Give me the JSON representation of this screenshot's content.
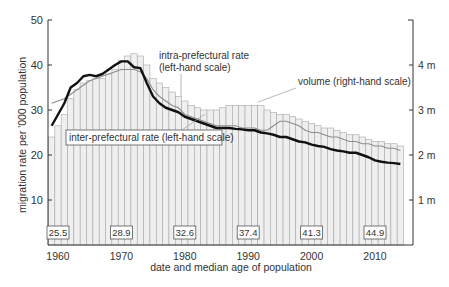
{
  "chart_data": {
    "type": "bar+line",
    "title": "",
    "xlabel": "date and median age of population",
    "ylabel": "migration rate per '000 population",
    "ylabel_right": "",
    "ylim": [
      0,
      50
    ],
    "ylim_right": [
      0,
      5
    ],
    "yticks": [
      10,
      20,
      30,
      40,
      50
    ],
    "yticks_right": [
      "1 m",
      "2 m",
      "3 m",
      "4 m"
    ],
    "xticks": [
      1960,
      1970,
      1980,
      1990,
      2000,
      2010
    ],
    "grid": false,
    "x": [
      1959,
      1960,
      1961,
      1962,
      1963,
      1964,
      1965,
      1966,
      1967,
      1968,
      1969,
      1970,
      1971,
      1972,
      1973,
      1974,
      1975,
      1976,
      1977,
      1978,
      1979,
      1980,
      1981,
      1982,
      1983,
      1984,
      1985,
      1986,
      1987,
      1988,
      1989,
      1990,
      1991,
      1992,
      1993,
      1994,
      1995,
      1996,
      1997,
      1998,
      1999,
      2000,
      2001,
      2002,
      2003,
      2004,
      2005,
      2006,
      2007,
      2008,
      2009,
      2010,
      2011,
      2012,
      2013,
      2014
    ],
    "series": [
      {
        "name": "volume (right-hand scale)",
        "type": "bar",
        "axis": "right",
        "unit": "millions",
        "values": [
          2.4,
          2.65,
          2.9,
          3.25,
          3.45,
          3.6,
          3.65,
          3.7,
          3.7,
          3.8,
          3.9,
          4.1,
          4.2,
          4.25,
          4.2,
          4.0,
          3.7,
          3.6,
          3.5,
          3.4,
          3.3,
          3.2,
          3.1,
          3.05,
          3.0,
          3.0,
          3.0,
          3.05,
          3.1,
          3.1,
          3.1,
          3.1,
          3.1,
          3.1,
          3.0,
          2.95,
          2.9,
          2.9,
          2.85,
          2.8,
          2.75,
          2.7,
          2.65,
          2.6,
          2.6,
          2.55,
          2.5,
          2.45,
          2.45,
          2.4,
          2.35,
          2.3,
          2.3,
          2.25,
          2.25,
          2.2
        ]
      },
      {
        "name": "intra-prefectural rate (left-hand scale)",
        "type": "line",
        "axis": "left",
        "values": [
          31.5,
          32.0,
          32.5,
          33.5,
          34.5,
          35.5,
          36.5,
          37.0,
          37.5,
          38.0,
          38.5,
          39.0,
          39.0,
          39.0,
          38.5,
          37.0,
          34.5,
          33.0,
          32.0,
          31.0,
          30.5,
          29.0,
          28.5,
          28.0,
          27.5,
          27.0,
          26.5,
          26.5,
          26.5,
          26.5,
          26.0,
          26.0,
          26.0,
          25.5,
          25.5,
          26.5,
          27.5,
          27.5,
          27.0,
          26.5,
          25.5,
          25.0,
          25.0,
          24.5,
          24.0,
          24.0,
          23.5,
          23.0,
          23.0,
          22.5,
          22.5,
          22.0,
          22.0,
          21.5,
          21.5,
          21.0
        ]
      },
      {
        "name": "inter-prefectural rate (left-hand scale)",
        "type": "line",
        "axis": "left",
        "values": [
          26.5,
          29.0,
          31.5,
          35.0,
          36.0,
          37.5,
          37.8,
          37.5,
          38.0,
          39.0,
          40.0,
          40.8,
          40.8,
          39.5,
          39.3,
          36.0,
          33.0,
          31.5,
          30.5,
          30.0,
          29.5,
          28.5,
          28.0,
          27.5,
          27.0,
          26.5,
          26.0,
          26.0,
          26.0,
          25.8,
          25.7,
          25.5,
          25.5,
          25.0,
          24.8,
          24.5,
          24.0,
          24.0,
          23.5,
          23.0,
          22.8,
          22.3,
          22.0,
          21.8,
          21.3,
          21.0,
          20.8,
          20.5,
          20.5,
          20.0,
          19.5,
          18.8,
          18.5,
          18.3,
          18.2,
          18.0
        ]
      }
    ],
    "median_age_labels": [
      {
        "year": 1960,
        "value": "25.5"
      },
      {
        "year": 1970,
        "value": "28.9"
      },
      {
        "year": 1980,
        "value": "32.6"
      },
      {
        "year": 1990,
        "value": "37.4"
      },
      {
        "year": 2000,
        "value": "41.3"
      },
      {
        "year": 2010,
        "value": "44.9"
      }
    ],
    "annotations": {
      "intra": [
        "intra-prefectural rate",
        "(left-hand scale)"
      ],
      "volume": "volume (right-hand scale)",
      "inter": "inter-prefectural rate (left-hand scale)"
    },
    "colors": {
      "bar_fill": "#efefef",
      "bar_stroke": "#a8a8a8",
      "inter_line": "#111111",
      "intra_line": "#8c8c8c",
      "axis": "#333333",
      "text": "#333333"
    }
  }
}
